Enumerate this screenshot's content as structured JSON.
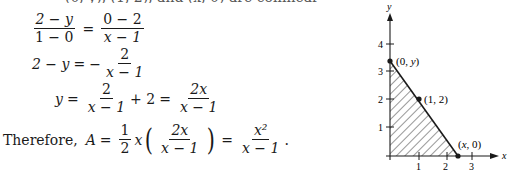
{
  "top_fragment": "(0, y), (1, 2), and (x, 0) are collinear",
  "equations": {
    "line1": {
      "lhs_num": "2 − y",
      "lhs_den": "1 − 0",
      "rhs_num": "0 − 2",
      "rhs_den": "x − 1"
    },
    "line2": {
      "lhs": "2 − y",
      "sign": "−",
      "rhs_num": "2",
      "rhs_den": "x − 1"
    },
    "line3": {
      "lhs": "y",
      "t1_num": "2",
      "t1_den": "x − 1",
      "plus": "+ 2",
      "rhs_num": "2x",
      "rhs_den": "x − 1"
    },
    "line4": {
      "prefix": "Therefore,",
      "lhs": "A",
      "half_num": "1",
      "half_den": "2",
      "x": "x",
      "inner_num": "2x",
      "inner_den": "x − 1",
      "result_num": "x²",
      "result_den": "x − 1",
      "period": "."
    }
  },
  "figure": {
    "x_axis_label": "x",
    "y_axis_label": "y",
    "x_ticks": [
      "1",
      "2",
      "3"
    ],
    "y_ticks": [
      "1",
      "2",
      "3",
      "4"
    ],
    "points": [
      {
        "label": "(0, y)",
        "x": 0,
        "y": 3.35
      },
      {
        "label": "(1, 2)",
        "x": 1,
        "y": 2
      },
      {
        "label": "(x, 0)",
        "x": 2.4,
        "y": 0
      }
    ],
    "shaded_region": "triangle with vertices (0,0), (0, y), (x, 0)",
    "hatch_color": "#1a1a1a"
  }
}
